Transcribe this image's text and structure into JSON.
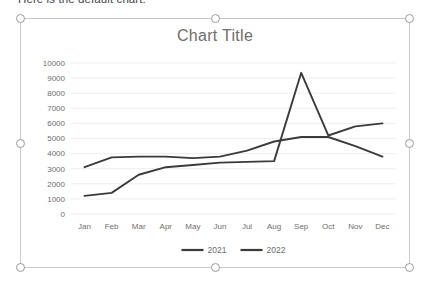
{
  "document": {
    "body_text": "Here is the default chart."
  },
  "chart_object": {
    "selected": true,
    "handle_names": [
      "top-left",
      "top-center",
      "top-right",
      "middle-left",
      "middle-right",
      "bottom-left",
      "bottom-center",
      "bottom-right"
    ]
  },
  "chart_data": {
    "type": "line",
    "title": "Chart Title",
    "xlabel": "",
    "ylabel": "",
    "categories": [
      "Jan",
      "Feb",
      "Mar",
      "Apr",
      "May",
      "Jun",
      "Jul",
      "Aug",
      "Sep",
      "Oct",
      "Nov",
      "Dec"
    ],
    "series": [
      {
        "name": "2021",
        "color": "#3b3b3b",
        "values": [
          3100,
          3750,
          3800,
          3800,
          3700,
          3800,
          4200,
          4800,
          5100,
          5100,
          4500,
          3800
        ]
      },
      {
        "name": "2022",
        "color": "#3b3b3b",
        "values": [
          1200,
          1400,
          2600,
          3100,
          3250,
          3400,
          3450,
          3500,
          9350,
          5200,
          5800,
          6000
        ]
      }
    ],
    "ylim": [
      0,
      10000
    ],
    "y_ticks": [
      10000,
      9000,
      8000,
      7000,
      6000,
      5000,
      4000,
      3000,
      2000,
      1000,
      0
    ],
    "grid": true,
    "legend": [
      "2021",
      "2022"
    ],
    "legend_position": "bottom"
  }
}
